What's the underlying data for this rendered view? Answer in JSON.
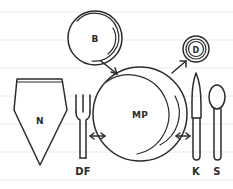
{
  "diagram": {
    "style": "hand-drawn sketch on ruled paper",
    "ink_color": "#2b2b2b",
    "paper_color": "#ffffff",
    "rule_color": "#e9ecef",
    "items": [
      {
        "key": "napkin",
        "label": "N",
        "name": "Napkin",
        "label_position": "inside",
        "cx": 40,
        "cy": 120
      },
      {
        "key": "dinner_fork",
        "label": "DF",
        "name": "Dinner Fork",
        "label_position": "below",
        "cx": 83,
        "cy": 170
      },
      {
        "key": "main_plate",
        "label": "MP",
        "name": "Main Plate",
        "label_position": "inside",
        "cx": 140,
        "cy": 114
      },
      {
        "key": "bread_plate",
        "label": "B",
        "name": "Bread Plate",
        "label_position": "inside",
        "cx": 95,
        "cy": 38
      },
      {
        "key": "drink_glass",
        "label": "D",
        "name": "Drink Glass",
        "label_position": "inside",
        "cx": 196,
        "cy": 49
      },
      {
        "key": "knife",
        "label": "K",
        "name": "Knife",
        "label_position": "below",
        "cx": 196,
        "cy": 170
      },
      {
        "key": "spoon",
        "label": "S",
        "name": "Spoon",
        "label_position": "below",
        "cx": 217,
        "cy": 170
      }
    ],
    "arrows": [
      {
        "key": "fork-to-plate",
        "name": "spacing-arrow-left",
        "type": "double-headed-horizontal",
        "x1": 89,
        "x2": 105,
        "y": 136
      },
      {
        "key": "plate-to-knife",
        "name": "spacing-arrow-right",
        "type": "double-headed-horizontal",
        "x1": 176,
        "x2": 191,
        "y": 136
      },
      {
        "key": "bread-to-plate",
        "name": "pointer-arrow-bread",
        "type": "single-headed-diagonal",
        "x1": 101,
        "y1": 61,
        "x2": 118,
        "y2": 74
      },
      {
        "key": "plate-to-glass",
        "name": "pointer-arrow-glass",
        "type": "single-headed-diagonal",
        "x1": 172,
        "y1": 73,
        "x2": 186,
        "y2": 61
      }
    ],
    "rule_lines_y": [
      12,
      40,
      68,
      96,
      124,
      152,
      180
    ]
  }
}
